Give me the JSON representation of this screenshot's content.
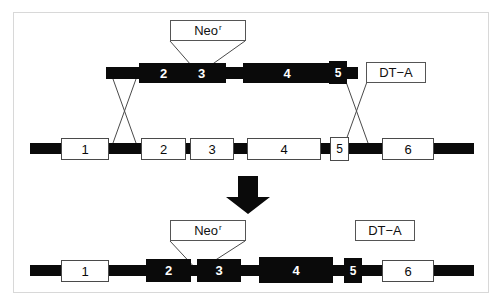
{
  "figure": {
    "colors": {
      "dna_black": "#0a0a0a",
      "box_outline": "#4a4a4a",
      "frame": "#d8d8d8",
      "background": "#ffffff"
    }
  },
  "targeting_vector": {
    "name": "targeting-vector",
    "neo_cassette": {
      "label": "Neo",
      "superscript": "r"
    },
    "negative_selection": {
      "label": "DT−A"
    },
    "exons": [
      {
        "id": "2",
        "label": "2",
        "fill": "black"
      },
      {
        "id": "3",
        "label": "3",
        "fill": "black"
      },
      {
        "id": "4",
        "label": "4",
        "fill": "black"
      },
      {
        "id": "5",
        "label": "5",
        "fill": "black"
      }
    ]
  },
  "endogenous_locus": {
    "name": "endogenous-locus",
    "exons": [
      {
        "id": "1",
        "label": "1",
        "fill": "white"
      },
      {
        "id": "2",
        "label": "2",
        "fill": "white"
      },
      {
        "id": "3",
        "label": "3",
        "fill": "white"
      },
      {
        "id": "4",
        "label": "4",
        "fill": "white"
      },
      {
        "id": "5",
        "label": "5",
        "fill": "white"
      },
      {
        "id": "6",
        "label": "6",
        "fill": "white"
      }
    ]
  },
  "recombinant_allele": {
    "name": "targeted-allele",
    "neo_cassette": {
      "label": "Neo",
      "superscript": "r"
    },
    "negative_selection": {
      "label": "DT−A"
    },
    "exons": [
      {
        "id": "1",
        "label": "1",
        "fill": "white"
      },
      {
        "id": "2",
        "label": "2",
        "fill": "black"
      },
      {
        "id": "3",
        "label": "3",
        "fill": "black"
      },
      {
        "id": "4",
        "label": "4",
        "fill": "black"
      },
      {
        "id": "5",
        "label": "5",
        "fill": "black"
      },
      {
        "id": "6",
        "label": "6",
        "fill": "white"
      }
    ]
  },
  "recombination_arrow": {
    "name": "down-arrow",
    "direction": "down"
  },
  "crossovers": [
    {
      "name": "left-crossover"
    },
    {
      "name": "right-crossover"
    }
  ]
}
